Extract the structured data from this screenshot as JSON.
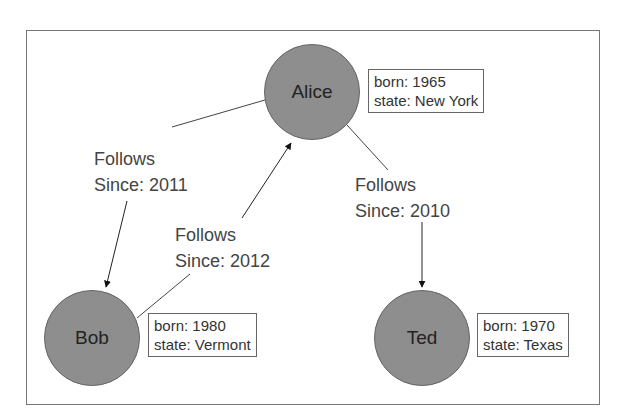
{
  "diagram": {
    "type": "property-graph",
    "nodes": [
      {
        "id": "alice",
        "label": "Alice",
        "props": [
          "born: 1965",
          "state: New York"
        ]
      },
      {
        "id": "bob",
        "label": "Bob",
        "props": [
          "born: 1980",
          "state: Vermont"
        ]
      },
      {
        "id": "ted",
        "label": "Ted",
        "props": [
          "born: 1970",
          "state: Texas"
        ]
      }
    ],
    "edges": [
      {
        "from": "alice",
        "to": "bob",
        "label": "Follows",
        "since": "Since: 2011"
      },
      {
        "from": "bob",
        "to": "alice",
        "label": "Follows",
        "since": "Since: 2012"
      },
      {
        "from": "alice",
        "to": "ted",
        "label": "Follows",
        "since": "Since: 2010"
      }
    ]
  },
  "colors": {
    "node_fill": "#9a9a9a",
    "stroke": "#555555",
    "frame": "#777777"
  }
}
